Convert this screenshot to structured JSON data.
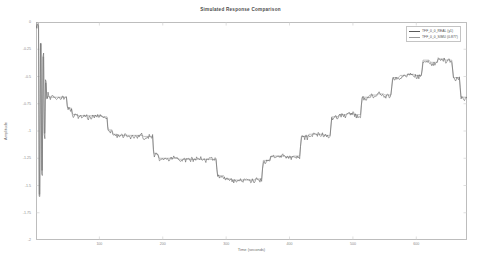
{
  "chart_data": {
    "type": "line",
    "title": "Simulated Response Comparison",
    "xlabel": "Time (seconds)",
    "ylabel": "Amplitude",
    "xlim": [
      0,
      680
    ],
    "ylim": [
      -2.0,
      0.0
    ],
    "grid": false,
    "legend_position": "top-right",
    "xticks": [
      100,
      200,
      300,
      400,
      500,
      600
    ],
    "xtick_labels": [
      "100",
      "200",
      "300",
      "400",
      "500",
      "600"
    ],
    "yticks": [
      0.0,
      -0.25,
      -0.5,
      -0.75,
      -1.0,
      -1.25,
      -1.5,
      -1.75,
      -2.0
    ],
    "ytick_labels": [
      "0",
      "-0.25",
      "-0.5",
      "-0.75",
      "-1",
      "-1.25",
      "-1.5",
      "-1.75",
      "-2"
    ],
    "series": [
      {
        "name": "TFF_0_0_REAL (y1)",
        "color": "#5a5a5a",
        "style": "noisy-staircase",
        "x": [
          0,
          4,
          6,
          8,
          10,
          12,
          14,
          16,
          18,
          20,
          24,
          28,
          34,
          40,
          48,
          56,
          64,
          72,
          80,
          88,
          96,
          104,
          112,
          120,
          128,
          136,
          144,
          152,
          160,
          168,
          176,
          184,
          192,
          200,
          212,
          224,
          236,
          248,
          260,
          272,
          284,
          296,
          308,
          320,
          332,
          344,
          356,
          368,
          380,
          392,
          404,
          416,
          428,
          440,
          452,
          464,
          476,
          488,
          500,
          512,
          524,
          536,
          548,
          560,
          572,
          584,
          596,
          608,
          620,
          632,
          644,
          656,
          668,
          680
        ],
        "y": [
          -0.02,
          -0.04,
          -1.62,
          -0.18,
          -1.4,
          -0.3,
          -1.05,
          -0.55,
          -0.72,
          -0.66,
          -0.7,
          -0.69,
          -0.7,
          -0.7,
          -0.7,
          -0.8,
          -0.86,
          -0.87,
          -0.86,
          -0.88,
          -0.87,
          -0.86,
          -0.88,
          -1.0,
          -1.04,
          -1.05,
          -1.04,
          -1.06,
          -1.05,
          -1.04,
          -1.06,
          -1.05,
          -1.22,
          -1.26,
          -1.26,
          -1.25,
          -1.27,
          -1.26,
          -1.25,
          -1.27,
          -1.26,
          -1.42,
          -1.45,
          -1.46,
          -1.45,
          -1.46,
          -1.45,
          -1.28,
          -1.24,
          -1.23,
          -1.25,
          -1.24,
          -1.06,
          -1.04,
          -1.03,
          -1.05,
          -0.88,
          -0.86,
          -0.84,
          -0.86,
          -0.7,
          -0.68,
          -0.66,
          -0.68,
          -0.52,
          -0.5,
          -0.48,
          -0.5,
          -0.36,
          -0.38,
          -0.34,
          -0.36,
          -0.52,
          -0.7
        ]
      },
      {
        "name": "TFF_0_0_SIMU (0.877)",
        "color": "#9a9a9a",
        "style": "smooth-staircase",
        "x": [
          0,
          4,
          6,
          8,
          10,
          12,
          14,
          16,
          18,
          20,
          24,
          28,
          34,
          40,
          48,
          56,
          64,
          72,
          80,
          88,
          96,
          104,
          112,
          120,
          128,
          136,
          144,
          152,
          160,
          168,
          176,
          184,
          192,
          200,
          212,
          224,
          236,
          248,
          260,
          272,
          284,
          296,
          308,
          320,
          332,
          344,
          356,
          368,
          380,
          392,
          404,
          416,
          428,
          440,
          452,
          464,
          476,
          488,
          500,
          512,
          524,
          536,
          548,
          560,
          572,
          584,
          596,
          608,
          620,
          632,
          644,
          656,
          668,
          680
        ],
        "y": [
          0.0,
          -0.01,
          -1.58,
          -0.2,
          -1.36,
          -0.32,
          -1.02,
          -0.56,
          -0.7,
          -0.68,
          -0.69,
          -0.69,
          -0.69,
          -0.69,
          -0.69,
          -0.79,
          -0.85,
          -0.86,
          -0.86,
          -0.86,
          -0.86,
          -0.86,
          -0.87,
          -0.99,
          -1.03,
          -1.04,
          -1.04,
          -1.04,
          -1.04,
          -1.04,
          -1.05,
          -1.05,
          -1.21,
          -1.25,
          -1.25,
          -1.25,
          -1.26,
          -1.26,
          -1.26,
          -1.26,
          -1.26,
          -1.41,
          -1.44,
          -1.45,
          -1.45,
          -1.45,
          -1.44,
          -1.27,
          -1.23,
          -1.23,
          -1.24,
          -1.23,
          -1.05,
          -1.03,
          -1.03,
          -1.04,
          -0.87,
          -0.85,
          -0.84,
          -0.85,
          -0.69,
          -0.67,
          -0.66,
          -0.67,
          -0.51,
          -0.49,
          -0.48,
          -0.49,
          -0.35,
          -0.37,
          -0.34,
          -0.35,
          -0.51,
          -0.69
        ]
      }
    ],
    "annotations": []
  },
  "legend": {
    "entries": [
      {
        "label": "TFF_0_0_REAL (y1)",
        "color": "#5a5a5a"
      },
      {
        "label": "TFF_0_0_SIMU (0.877)",
        "color": "#9a9a9a"
      }
    ]
  }
}
